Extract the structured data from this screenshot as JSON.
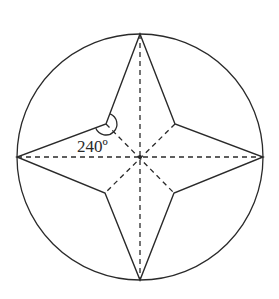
{
  "diagram": {
    "type": "geometry",
    "colors": {
      "stroke": "#2a2a2a",
      "background": "#ffffff"
    },
    "circle": {
      "cx": 140,
      "cy": 157,
      "r": 123
    },
    "center_point": {
      "x": 140,
      "y": 157
    },
    "outer_vertices": [
      {
        "name": "top",
        "x": 140,
        "y": 34
      },
      {
        "name": "right",
        "x": 263,
        "y": 157
      },
      {
        "name": "bottom",
        "x": 140,
        "y": 280
      },
      {
        "name": "left",
        "x": 17,
        "y": 157
      }
    ],
    "inner_vertices": [
      {
        "name": "upper-right",
        "x": 175,
        "y": 124
      },
      {
        "name": "lower-right",
        "x": 174,
        "y": 193
      },
      {
        "name": "lower-left",
        "x": 105,
        "y": 193
      },
      {
        "name": "upper-left",
        "x": 106,
        "y": 124
      }
    ],
    "angle_marker": {
      "vertex": "upper-left",
      "value": "240°",
      "label": "240º"
    },
    "labels": {
      "angle": "240º"
    }
  }
}
